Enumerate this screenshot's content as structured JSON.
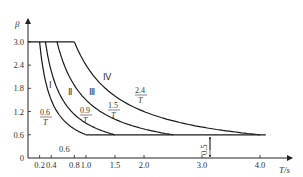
{
  "chart_data": {
    "type": "line",
    "title": "",
    "xlabel": "T/s",
    "ylabel": "β",
    "xlim": [
      0,
      4.5
    ],
    "ylim": [
      0,
      3.0
    ],
    "grid": false,
    "legend": "none",
    "x_ticks": [
      "0.2",
      "0.4",
      "0.8",
      "1.0",
      "1.5",
      "2.0",
      "3.0",
      "4.0"
    ],
    "x_tick_values": [
      0.2,
      0.4,
      0.8,
      1.0,
      1.5,
      2.0,
      3.0,
      4.0
    ],
    "y_ticks": [
      "0",
      "0.6",
      "1.2",
      "1.8",
      "2.4",
      "3.0"
    ],
    "y_tick_values": [
      0,
      0.6,
      1.2,
      1.8,
      2.4,
      3.0
    ],
    "plateau_value": 3.0,
    "floor_value": 0.6,
    "series": [
      {
        "name": "Ⅰ",
        "formula": "0.6/T",
        "coef": 0.6,
        "plateau_end_T": 0.2,
        "floor_start_T": 1.0
      },
      {
        "name": "Ⅱ",
        "formula": "0.9/T",
        "coef": 0.9,
        "plateau_end_T": 0.3,
        "floor_start_T": 1.5
      },
      {
        "name": "Ⅲ",
        "formula": "1.5/T",
        "coef": 1.5,
        "plateau_end_T": 0.5,
        "floor_start_T": 2.5
      },
      {
        "name": "Ⅳ",
        "formula": "2.4/T",
        "coef": 2.4,
        "plateau_end_T": 0.8,
        "floor_start_T": 4.0
      }
    ],
    "floor_line_end_T": 4.1,
    "annotations": [
      {
        "text": "0.6/T",
        "numerator": "0.6",
        "denominator": "T"
      },
      {
        "text": "0.9/T",
        "numerator": "0.9",
        "denominator": "T"
      },
      {
        "text": "1.5/T",
        "numerator": "1.5",
        "denominator": "T"
      },
      {
        "text": "2.4/T",
        "numerator": "2.4",
        "denominator": "T"
      },
      {
        "text": "0.6",
        "note": "marker near x-axis under curve Ⅰ/Ⅱ region"
      },
      {
        "text": "0.5",
        "note": "vertical dimension arrow between x-axis and floor line near T=3.0"
      }
    ]
  },
  "labels": {
    "y_axis": "β",
    "x_axis": "T/s",
    "roman_1": "Ⅰ",
    "roman_2": "Ⅱ",
    "roman_3": "Ⅲ",
    "roman_4": "Ⅳ",
    "frac_1_num": "0.6",
    "frac_1_den": "T",
    "frac_2_num": "0.9",
    "frac_2_den": "T",
    "frac_3_num": "1.5",
    "frac_3_den": "T",
    "frac_4_num": "2.4",
    "frac_4_den": "T",
    "note_06": "0.6",
    "note_05": "0.5",
    "origin": "0"
  }
}
